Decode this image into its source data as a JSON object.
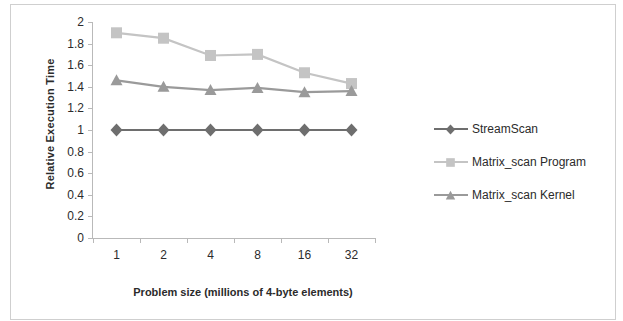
{
  "chart_data": {
    "type": "line",
    "title": "",
    "xlabel": "Problem size (millions of 4-byte elements)",
    "ylabel": "Relative Execution Time",
    "categories": [
      "1",
      "2",
      "4",
      "8",
      "16",
      "32"
    ],
    "ylim": [
      0,
      2
    ],
    "ytick_labels": [
      "0",
      "0.2",
      "0.4",
      "0.6",
      "0.8",
      "1",
      "1.2",
      "1.4",
      "1.6",
      "1.8",
      "2"
    ],
    "ytick_values": [
      0,
      0.2,
      0.4,
      0.6,
      0.8,
      1,
      1.2,
      1.4,
      1.6,
      1.8,
      2
    ],
    "grid": false,
    "legend_position": "right",
    "series": [
      {
        "name": "StreamScan",
        "marker": "diamond",
        "color": "#6e6e6e",
        "values": [
          1.0,
          1.0,
          1.0,
          1.0,
          1.0,
          1.0
        ]
      },
      {
        "name": "Matrix_scan Program",
        "marker": "square",
        "color": "#c4c4c4",
        "values": [
          1.9,
          1.85,
          1.69,
          1.7,
          1.53,
          1.43
        ]
      },
      {
        "name": "Matrix_scan Kernel",
        "marker": "triangle",
        "color": "#9a9a9a",
        "values": [
          1.46,
          1.4,
          1.37,
          1.39,
          1.35,
          1.36
        ]
      }
    ]
  },
  "axes": {
    "y_title": "Relative Execution Time",
    "x_title": "Problem size (millions of 4-byte elements)"
  },
  "legend": {
    "items": [
      {
        "label": "StreamScan"
      },
      {
        "label": "Matrix_scan Program"
      },
      {
        "label": "Matrix_scan Kernel"
      }
    ]
  },
  "colors": {
    "axis": "#b9b9b9",
    "text": "#2b2b2b",
    "frame": "#cfcfcf",
    "series_stream_scan": "#6e6e6e",
    "series_matrix_program": "#c4c4c4",
    "series_matrix_kernel": "#9a9a9a"
  }
}
